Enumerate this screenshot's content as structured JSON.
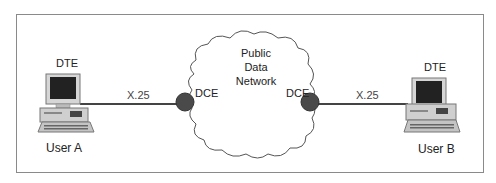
{
  "diagram": {
    "type": "network-topology",
    "title": "",
    "nodes": {
      "user_a": {
        "role": "DTE",
        "label": "User A",
        "icon": "desktop-computer-icon"
      },
      "user_b": {
        "role": "DTE",
        "label": "User B",
        "icon": "desktop-computer-icon"
      },
      "dce_left": {
        "label": "DCE"
      },
      "dce_right": {
        "label": "DCE"
      },
      "network": {
        "line1": "Public",
        "line2": "Data",
        "line3": "Network"
      }
    },
    "links": [
      {
        "from": "User A",
        "to": "DCE (left)",
        "label": "X.25"
      },
      {
        "from": "DCE (right)",
        "to": "User B",
        "label": "X.25"
      }
    ],
    "colors": {
      "frame": "#8a8a8a",
      "line": "#444444",
      "dce_fill": "#4a4a4a",
      "cloud_stroke": "#555555"
    }
  }
}
